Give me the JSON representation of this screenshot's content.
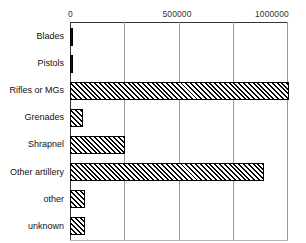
{
  "chart_data": {
    "type": "bar",
    "orientation": "horizontal",
    "title": "",
    "xlabel": "",
    "ylabel": "",
    "xlim": [
      0,
      1000000
    ],
    "grid": true,
    "legend": "none",
    "xticks": [
      {
        "value": 0,
        "label": "0"
      },
      {
        "value": 250000,
        "label": ""
      },
      {
        "value": 500000,
        "label": "500000"
      },
      {
        "value": 750000,
        "label": ""
      },
      {
        "value": 1000000,
        "label": "1000000"
      }
    ],
    "categories": [
      "Blades",
      "Pistols",
      "Rifles or MGs",
      "Grenades",
      "Shrapnel",
      "Other artillery",
      "other",
      "unknown"
    ],
    "values": [
      15000,
      14000,
      1010000,
      60000,
      255000,
      895000,
      70000,
      70000
    ],
    "bar_styles": [
      "solid-dark",
      "solid-dark",
      "hatched",
      "hatched",
      "hatched",
      "hatched",
      "hatched",
      "hatched"
    ],
    "colors": {
      "bar_fill": "#ffffff",
      "bar_hatch": "#000000",
      "bar_border": "#000000",
      "gridline": "#9a9a9a",
      "axis": "#333333",
      "text": "#111111",
      "background": "#ffffff"
    }
  }
}
